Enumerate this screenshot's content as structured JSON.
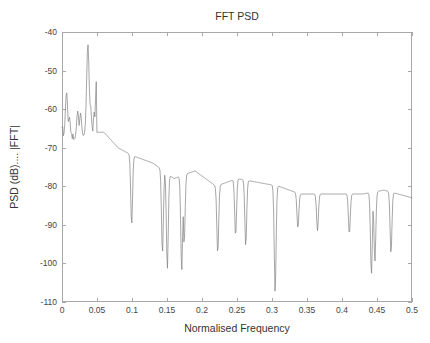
{
  "chart_data": {
    "type": "line",
    "title": "FFT PSD",
    "xlabel": "Normalised Frequency",
    "ylabel": "PSD (dB).... |FFT|",
    "xlim": [
      0,
      0.5
    ],
    "ylim": [
      -110,
      -40
    ],
    "grid": false,
    "legend": null,
    "line_color": "#808080",
    "axis_color": "#a8a8a8",
    "background_color": "#ffffff",
    "xticks": [
      0,
      0.05,
      0.1,
      0.15,
      0.2,
      0.25,
      0.3,
      0.35,
      0.4,
      0.45,
      0.5
    ],
    "xtick_labels": [
      "0",
      "0.05",
      "0.1",
      "0.15",
      "0.2",
      "0.25",
      "0.3",
      "0.35",
      "0.4",
      "0.45",
      "0.5"
    ],
    "yticks": [
      -40,
      -50,
      -60,
      -70,
      -80,
      -90,
      -100,
      -110
    ],
    "ytick_labels": [
      "-40",
      "-50",
      "-60",
      "-70",
      "-80",
      "-90",
      "-100",
      "-110"
    ],
    "series_name": "FFT PSD",
    "n_points": 512,
    "noise_seed": 20250411,
    "envelope_description": "Broadband noise spectrum decaying from about -65 dB near DC to about -84 dB at 0.5 normalised frequency, with sharp spectral peaks superposed.",
    "envelope_knots_x": [
      0.0,
      0.02,
      0.04,
      0.06,
      0.08,
      0.1,
      0.13,
      0.16,
      0.19,
      0.22,
      0.25,
      0.28,
      0.31,
      0.34,
      0.37,
      0.4,
      0.43,
      0.46,
      0.5
    ],
    "envelope_knots_y": [
      -67,
      -68,
      -66,
      -66,
      -70,
      -72,
      -74,
      -78,
      -76,
      -80,
      -78,
      -79,
      -80,
      -82,
      -82,
      -82,
      -82,
      -81,
      -83
    ],
    "noise_sigma_knots_x": [
      0.0,
      0.08,
      0.16,
      0.24,
      0.32,
      0.4,
      0.5
    ],
    "noise_sigma_knots_y": [
      6.5,
      7.5,
      8.0,
      7.0,
      6.0,
      4.5,
      4.2
    ],
    "peaks": [
      {
        "x": 0.0065,
        "y": -55.5,
        "width": 0.0016
      },
      {
        "x": 0.0105,
        "y": -62.0,
        "width": 0.0014
      },
      {
        "x": 0.0225,
        "y": -60.5,
        "width": 0.0016
      },
      {
        "x": 0.0265,
        "y": -61.0,
        "width": 0.0014
      },
      {
        "x": 0.037,
        "y": -43.2,
        "width": 0.0018
      },
      {
        "x": 0.0405,
        "y": -58.5,
        "width": 0.0014
      },
      {
        "x": 0.0495,
        "y": -52.0,
        "width": 0.0016
      },
      {
        "x": 0.053,
        "y": -55.0,
        "width": 0.0014
      },
      {
        "x": 0.057,
        "y": -48.8,
        "width": 0.0016
      },
      {
        "x": 0.0625,
        "y": -41.8,
        "width": 0.0018
      },
      {
        "x": 0.0655,
        "y": -52.5,
        "width": 0.0014
      },
      {
        "x": 0.072,
        "y": -46.5,
        "width": 0.0017
      },
      {
        "x": 0.079,
        "y": -56.5,
        "width": 0.0015
      },
      {
        "x": 0.089,
        "y": -62.0,
        "width": 0.0014
      },
      {
        "x": 0.108,
        "y": -60.5,
        "width": 0.0015
      },
      {
        "x": 0.114,
        "y": -54.5,
        "width": 0.0016
      },
      {
        "x": 0.1225,
        "y": -63.0,
        "width": 0.0014
      },
      {
        "x": 0.1285,
        "y": -48.2,
        "width": 0.0018
      },
      {
        "x": 0.132,
        "y": -62.0,
        "width": 0.0014
      },
      {
        "x": 0.152,
        "y": -63.5,
        "width": 0.0015
      },
      {
        "x": 0.1545,
        "y": -61.5,
        "width": 0.0015
      },
      {
        "x": 0.16,
        "y": -68.5,
        "width": 0.0014
      },
      {
        "x": 0.189,
        "y": -59.5,
        "width": 0.0016
      },
      {
        "x": 0.1935,
        "y": -57.0,
        "width": 0.0017
      },
      {
        "x": 0.1985,
        "y": -66.0,
        "width": 0.0014
      },
      {
        "x": 0.231,
        "y": -70.5,
        "width": 0.0015
      },
      {
        "x": 0.2355,
        "y": -71.5,
        "width": 0.0014
      },
      {
        "x": 0.2575,
        "y": -62.0,
        "width": 0.0016
      },
      {
        "x": 0.261,
        "y": -60.8,
        "width": 0.0017
      },
      {
        "x": 0.272,
        "y": -70.0,
        "width": 0.0015
      },
      {
        "x": 0.287,
        "y": -70.5,
        "width": 0.0015
      },
      {
        "x": 0.323,
        "y": -62.5,
        "width": 0.0017
      },
      {
        "x": 0.327,
        "y": -70.0,
        "width": 0.0014
      },
      {
        "x": 0.39,
        "y": -73.0,
        "width": 0.0015
      },
      {
        "x": 0.455,
        "y": -73.5,
        "width": 0.0015
      },
      {
        "x": 0.46,
        "y": -76.0,
        "width": 0.0014
      }
    ],
    "nulls": [
      {
        "x": 0.0995,
        "y": -90.0,
        "width": 0.0013
      },
      {
        "x": 0.1435,
        "y": -97.5,
        "width": 0.0013
      },
      {
        "x": 0.1505,
        "y": -101.5,
        "width": 0.0013
      },
      {
        "x": 0.171,
        "y": -102.0,
        "width": 0.0013
      },
      {
        "x": 0.1745,
        "y": -95.0,
        "width": 0.0013
      },
      {
        "x": 0.2225,
        "y": -97.5,
        "width": 0.0013
      },
      {
        "x": 0.248,
        "y": -93.0,
        "width": 0.0013
      },
      {
        "x": 0.2625,
        "y": -95.5,
        "width": 0.0013
      },
      {
        "x": 0.3045,
        "y": -107.5,
        "width": 0.0013
      },
      {
        "x": 0.337,
        "y": -91.0,
        "width": 0.0013
      },
      {
        "x": 0.365,
        "y": -91.5,
        "width": 0.0013
      },
      {
        "x": 0.4105,
        "y": -92.5,
        "width": 0.0013
      },
      {
        "x": 0.442,
        "y": -103.0,
        "width": 0.0013
      },
      {
        "x": 0.447,
        "y": -99.5,
        "width": 0.0013
      },
      {
        "x": 0.47,
        "y": -97.5,
        "width": 0.0013
      }
    ]
  },
  "plot_box": {
    "left": 62,
    "top": 32,
    "right": 412,
    "bottom": 302
  },
  "labels": {
    "title": "FFT PSD",
    "xlabel": "Normalised Frequency",
    "ylabel": "PSD (dB).... |FFT|"
  }
}
